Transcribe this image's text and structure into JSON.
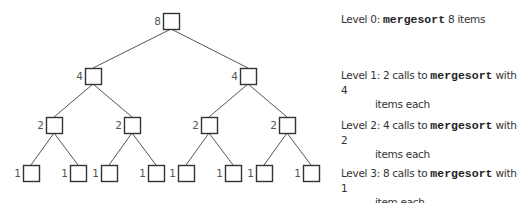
{
  "tree": {
    "nodes": [
      {
        "id": "n0",
        "level": 0,
        "label": "8",
        "x": 163,
        "y": 13
      },
      {
        "id": "n1",
        "level": 1,
        "label": "4",
        "x": 85,
        "y": 68
      },
      {
        "id": "n2",
        "level": 1,
        "label": "4",
        "x": 240,
        "y": 68
      },
      {
        "id": "n3",
        "level": 2,
        "label": "2",
        "x": 46,
        "y": 117
      },
      {
        "id": "n4",
        "level": 2,
        "label": "2",
        "x": 124,
        "y": 117
      },
      {
        "id": "n5",
        "level": 2,
        "label": "2",
        "x": 201,
        "y": 117
      },
      {
        "id": "n6",
        "level": 2,
        "label": "2",
        "x": 279,
        "y": 117
      },
      {
        "id": "n7",
        "level": 3,
        "label": "1",
        "x": 23,
        "y": 165
      },
      {
        "id": "n8",
        "level": 3,
        "label": "1",
        "x": 70,
        "y": 165
      },
      {
        "id": "n9",
        "level": 3,
        "label": "1",
        "x": 101,
        "y": 165
      },
      {
        "id": "n10",
        "level": 3,
        "label": "1",
        "x": 148,
        "y": 165
      },
      {
        "id": "n11",
        "level": 3,
        "label": "1",
        "x": 178,
        "y": 165
      },
      {
        "id": "n12",
        "level": 3,
        "label": "1",
        "x": 225,
        "y": 165
      },
      {
        "id": "n13",
        "level": 3,
        "label": "1",
        "x": 256,
        "y": 165
      },
      {
        "id": "n14",
        "level": 3,
        "label": "1",
        "x": 303,
        "y": 165
      }
    ],
    "edges": [
      [
        "n0",
        "n1"
      ],
      [
        "n0",
        "n2"
      ],
      [
        "n1",
        "n3"
      ],
      [
        "n1",
        "n4"
      ],
      [
        "n2",
        "n5"
      ],
      [
        "n2",
        "n6"
      ],
      [
        "n3",
        "n7"
      ],
      [
        "n3",
        "n8"
      ],
      [
        "n4",
        "n9"
      ],
      [
        "n4",
        "n10"
      ],
      [
        "n5",
        "n11"
      ],
      [
        "n5",
        "n12"
      ],
      [
        "n6",
        "n13"
      ],
      [
        "n6",
        "n14"
      ]
    ],
    "box_size": 16,
    "line_color": "#555555",
    "box_color": "#333333",
    "label_color": "#555555"
  },
  "levels": [
    {
      "prefix": "Level 0: ",
      "code": "mergesort",
      "suffix": " 8 items",
      "cont": "",
      "top": 12
    },
    {
      "prefix": "Level 1: 2 calls to ",
      "code": "mergesort",
      "suffix": " with 4",
      "cont": "items each",
      "top": 68
    },
    {
      "prefix": "Level 2: 4 calls to ",
      "code": "mergesort",
      "suffix": " with 2",
      "cont": "items each",
      "top": 118
    },
    {
      "prefix": "Level 3: 8 calls to ",
      "code": "mergesort",
      "suffix": " with 1",
      "cont": "item each",
      "top": 166
    }
  ]
}
